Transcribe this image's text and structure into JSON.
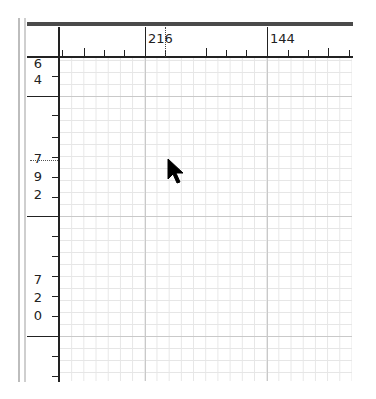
{
  "canvas": {
    "background": "#ffffff",
    "grid_minor_color": "#e6e6e6",
    "grid_major_color": "#c9c9c9",
    "ruler_color": "#222222"
  },
  "horizontal_ruler": {
    "labels": [
      {
        "text": "216",
        "x": 145
      },
      {
        "text": "144",
        "x": 267
      }
    ],
    "guide_marker": {
      "x": 165,
      "style": "dotted"
    }
  },
  "vertical_ruler": {
    "labels": [
      {
        "digits": [
          "6",
          "4"
        ],
        "y": 57
      },
      {
        "digits": [
          "7",
          "9",
          "2"
        ],
        "y": 160
      },
      {
        "digits": [
          "7",
          "2",
          "0"
        ],
        "y": 270
      }
    ],
    "guide_marker": {
      "y": 160,
      "style": "dotted"
    }
  },
  "cursor": {
    "icon": "arrow-pointer-icon",
    "x": 168,
    "y": 160
  }
}
